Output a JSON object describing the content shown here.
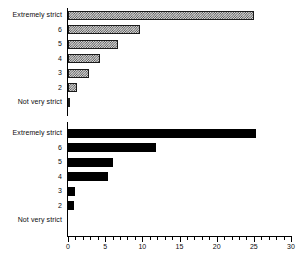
{
  "chart_data": [
    {
      "type": "bar",
      "orientation": "horizontal",
      "panel": "top",
      "title": "",
      "xlabel": "",
      "ylabel": "",
      "xlim": [
        0,
        30
      ],
      "xticks": [
        0,
        5,
        10,
        15,
        20,
        25,
        30
      ],
      "xtick_labels": [
        "0",
        "5",
        "10",
        "15",
        "20",
        "25",
        "30"
      ],
      "minor_tick_step": 1,
      "grid": false,
      "legend": "none",
      "fill": "hatched",
      "categories": [
        "Extremely strict",
        "6",
        "5",
        "4",
        "3",
        "2",
        "Not very strict"
      ],
      "values": [
        25.0,
        9.7,
        6.7,
        4.3,
        2.8,
        1.2,
        0.3
      ]
    },
    {
      "type": "bar",
      "orientation": "horizontal",
      "panel": "bottom",
      "title": "",
      "xlabel": "",
      "ylabel": "",
      "xlim": [
        0,
        30
      ],
      "xticks": [
        0,
        5,
        10,
        15,
        20,
        25,
        30
      ],
      "xtick_labels": [
        "0",
        "5",
        "10",
        "15",
        "20",
        "25",
        "30"
      ],
      "minor_tick_step": 1,
      "grid": false,
      "legend": "none",
      "fill": "solid",
      "categories": [
        "Extremely strict",
        "6",
        "5",
        "4",
        "3",
        "2",
        "Not very strict"
      ],
      "values": [
        25.3,
        11.9,
        6.1,
        5.4,
        0.9,
        0.8,
        0.0
      ]
    }
  ],
  "colors": {
    "axis": "#000000",
    "text": "#0d0d0d",
    "bar_solid": "#000000",
    "bar_hatch_dark": "#4a4a4a",
    "bar_hatch_light": "#d9d9d9",
    "bar_outline": "#1a1a1a",
    "background": "#ffffff"
  }
}
